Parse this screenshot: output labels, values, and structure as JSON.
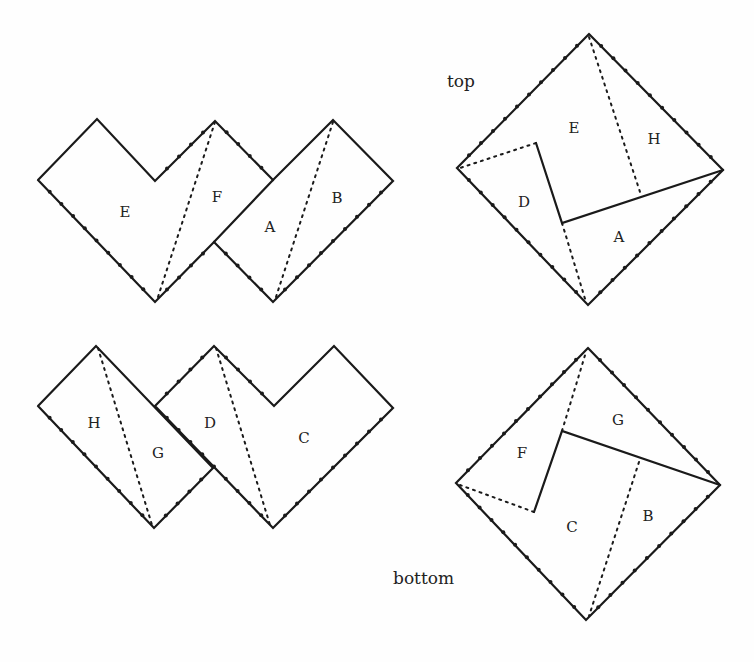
{
  "captions": {
    "top": "top",
    "bottom": "bottom"
  },
  "figures": [
    {
      "name": "net-top-left",
      "solid": [
        [
          [
            38,
            180
          ],
          [
            97,
            119
          ],
          [
            155,
            181
          ],
          [
            215,
            121
          ],
          [
            273,
            180
          ],
          [
            333,
            120
          ],
          [
            393,
            181
          ],
          [
            273,
            302
          ],
          [
            214,
            242
          ],
          [
            155,
            302
          ],
          [
            38,
            180
          ]
        ],
        [
          [
            214,
            242
          ],
          [
            273,
            180
          ]
        ]
      ],
      "dotted": [
        [
          [
            215,
            122
          ],
          [
            157,
            300
          ]
        ],
        [
          [
            333,
            122
          ],
          [
            275,
            300
          ]
        ]
      ],
      "ticks": [
        [
          [
            38,
            180
          ],
          [
            155,
            302
          ]
        ],
        [
          [
            155,
            302
          ],
          [
            215,
            242
          ]
        ],
        [
          [
            155,
            181
          ],
          [
            215,
            121
          ]
        ],
        [
          [
            215,
            121
          ],
          [
            273,
            180
          ]
        ],
        [
          [
            214,
            242
          ],
          [
            273,
            302
          ]
        ],
        [
          [
            273,
            302
          ],
          [
            393,
            181
          ]
        ]
      ],
      "labels": [
        {
          "t": "E",
          "x": 125,
          "y": 217
        },
        {
          "t": "F",
          "x": 217,
          "y": 202
        },
        {
          "t": "A",
          "x": 270,
          "y": 232
        },
        {
          "t": "B",
          "x": 337,
          "y": 203
        }
      ]
    },
    {
      "name": "square-top",
      "solid": [
        [
          [
            589,
            34
          ],
          [
            723,
            170
          ],
          [
            588,
            305
          ],
          [
            457,
            168
          ],
          [
            589,
            34
          ]
        ],
        [
          [
            536,
            143
          ],
          [
            562,
            223
          ],
          [
            723,
            170
          ]
        ]
      ],
      "dotted": [
        [
          [
            589,
            37
          ],
          [
            641,
            195
          ]
        ],
        [
          [
            536,
            143
          ],
          [
            460,
            168
          ]
        ],
        [
          [
            562,
            223
          ],
          [
            586,
            302
          ]
        ]
      ],
      "ticks": [
        [
          [
            457,
            168
          ],
          [
            589,
            34
          ]
        ],
        [
          [
            589,
            34
          ],
          [
            723,
            170
          ]
        ],
        [
          [
            723,
            170
          ],
          [
            588,
            305
          ]
        ],
        [
          [
            588,
            305
          ],
          [
            457,
            168
          ]
        ]
      ],
      "labels": [
        {
          "t": "E",
          "x": 574,
          "y": 133
        },
        {
          "t": "H",
          "x": 654,
          "y": 144
        },
        {
          "t": "D",
          "x": 524,
          "y": 207
        },
        {
          "t": "A",
          "x": 619,
          "y": 242
        }
      ]
    },
    {
      "name": "net-bottom-left",
      "solid": [
        [
          [
            38,
            406
          ],
          [
            96,
            346
          ],
          [
            213,
            468
          ],
          [
            154,
            528
          ],
          [
            38,
            406
          ]
        ],
        [
          [
            155,
            406
          ],
          [
            214,
            346
          ],
          [
            274,
            406
          ],
          [
            334,
            346
          ],
          [
            393,
            408
          ],
          [
            273,
            528
          ],
          [
            155,
            406
          ]
        ]
      ],
      "dotted": [
        [
          [
            98,
            348
          ],
          [
            152,
            525
          ]
        ],
        [
          [
            216,
            348
          ],
          [
            270,
            525
          ]
        ]
      ],
      "ticks": [
        [
          [
            38,
            406
          ],
          [
            154,
            528
          ]
        ],
        [
          [
            154,
            528
          ],
          [
            213,
            468
          ]
        ],
        [
          [
            155,
            406
          ],
          [
            214,
            346
          ]
        ],
        [
          [
            214,
            346
          ],
          [
            274,
            406
          ]
        ],
        [
          [
            155,
            406
          ],
          [
            273,
            528
          ]
        ],
        [
          [
            273,
            528
          ],
          [
            393,
            408
          ]
        ]
      ],
      "labels": [
        {
          "t": "H",
          "x": 94,
          "y": 428
        },
        {
          "t": "G",
          "x": 158,
          "y": 458
        },
        {
          "t": "D",
          "x": 210,
          "y": 428
        },
        {
          "t": "C",
          "x": 304,
          "y": 443
        }
      ]
    },
    {
      "name": "square-bottom",
      "solid": [
        [
          [
            588,
            348
          ],
          [
            720,
            485
          ],
          [
            586,
            620
          ],
          [
            456,
            483
          ],
          [
            588,
            348
          ]
        ],
        [
          [
            534,
            512
          ],
          [
            562,
            431
          ],
          [
            720,
            485
          ]
        ]
      ],
      "dotted": [
        [
          [
            562,
            431
          ],
          [
            586,
            352
          ]
        ],
        [
          [
            534,
            512
          ],
          [
            460,
            485
          ]
        ],
        [
          [
            639,
            462
          ],
          [
            589,
            616
          ]
        ]
      ],
      "ticks": [
        [
          [
            456,
            483
          ],
          [
            588,
            348
          ]
        ],
        [
          [
            588,
            348
          ],
          [
            720,
            485
          ]
        ],
        [
          [
            720,
            485
          ],
          [
            586,
            620
          ]
        ],
        [
          [
            586,
            620
          ],
          [
            456,
            483
          ]
        ]
      ],
      "labels": [
        {
          "t": "G",
          "x": 618,
          "y": 425
        },
        {
          "t": "F",
          "x": 522,
          "y": 458
        },
        {
          "t": "C",
          "x": 572,
          "y": 532
        },
        {
          "t": "B",
          "x": 648,
          "y": 521
        }
      ]
    }
  ]
}
